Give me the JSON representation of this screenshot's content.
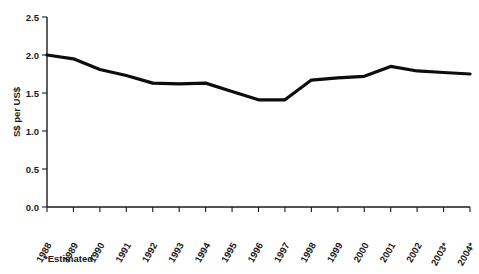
{
  "chart_data": {
    "type": "line",
    "title": "",
    "xlabel": "",
    "ylabel": "S$ per US$",
    "categories": [
      "1988",
      "1989",
      "1990",
      "1991",
      "1992",
      "1993",
      "1994",
      "1995",
      "1996",
      "1997",
      "1998",
      "1999",
      "2000",
      "2001",
      "2002",
      "2003*",
      "2004*"
    ],
    "values": [
      2.0,
      1.95,
      1.81,
      1.73,
      1.63,
      1.62,
      1.63,
      1.52,
      1.41,
      1.41,
      1.67,
      1.7,
      1.72,
      1.85,
      1.79,
      1.77,
      1.75
    ],
    "series": [
      {
        "name": "S$ per US$",
        "values": [
          2.0,
          1.95,
          1.81,
          1.73,
          1.63,
          1.62,
          1.63,
          1.52,
          1.41,
          1.41,
          1.67,
          1.7,
          1.72,
          1.85,
          1.79,
          1.77,
          1.75
        ]
      }
    ],
    "ylim": [
      0.0,
      2.5
    ],
    "ytick_labels": [
      "0.0",
      "0.5",
      "1.0",
      "1.5",
      "2.0",
      "2.5"
    ],
    "ytick_values": [
      0.0,
      0.5,
      1.0,
      1.5,
      2.0,
      2.5
    ],
    "grid": false,
    "legend": "none",
    "line_color": "#0d0d0d",
    "annotations": [
      "*Estimated"
    ]
  },
  "axes": {
    "y_title": "S$ per US$"
  },
  "footnote": {
    "text": "*Estimated"
  }
}
